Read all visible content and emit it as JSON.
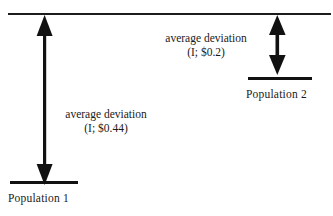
{
  "figure": {
    "title": "",
    "background_color": "#ffffff",
    "ink_color": "#111111"
  },
  "top_rule": {
    "name": "reference-line",
    "label": ""
  },
  "populations": [
    {
      "id": "population-1",
      "bar_label": "Population 1",
      "deviation_label_line1": "average deviation",
      "deviation_label_line2": "(I; $0.44)",
      "deviation_value": 0.44,
      "deviation_symbol": "I",
      "arrow_type": "single-headed-down",
      "arrow_span_px": 168
    },
    {
      "id": "population-2",
      "bar_label": "Population 2",
      "deviation_label_line1": "average deviation",
      "deviation_label_line2": "(I; $0.2)",
      "deviation_value": 0.2,
      "deviation_symbol": "I",
      "arrow_type": "double-headed",
      "arrow_span_px": 58
    }
  ]
}
